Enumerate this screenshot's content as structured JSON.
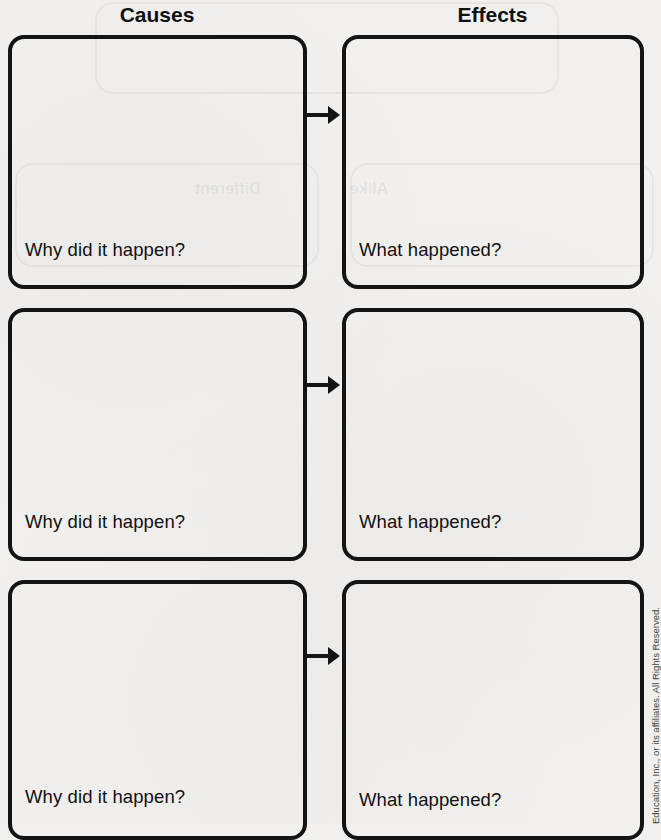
{
  "worksheet": {
    "columns": {
      "causes_header": "Causes",
      "effects_header": "Effects"
    },
    "rows": [
      {
        "cause_prompt": "Why did it happen?",
        "effect_prompt": "What happened?",
        "connector_icon": "arrow-right-icon"
      },
      {
        "cause_prompt": "Why did it happen?",
        "effect_prompt": "What happened?",
        "connector_icon": "arrow-right-icon"
      },
      {
        "cause_prompt": "Why did it happen?",
        "effect_prompt": "What happened?",
        "connector_icon": "arrow-right-icon"
      }
    ],
    "footer": {
      "copyright": "Education, Inc., or its affiliates. All Rights Reserved."
    },
    "bleed_through": {
      "left_label": "Different",
      "right_label": "Alike"
    }
  },
  "colors": {
    "paper": "#f1f0ee",
    "ink": "#141414"
  }
}
